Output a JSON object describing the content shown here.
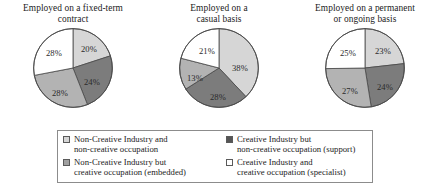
{
  "chart_data": [
    {
      "type": "pie",
      "title": "Employed on a fixed-term contract",
      "title_lines": [
        "Employed on a fixed-term",
        "contract"
      ],
      "categories": [
        "Non-Creative Industry and non-creative occupation",
        "Creative Industry but non-creative occupation (support)",
        "Non-Creative Industry but creative occupation (embedded)",
        "Creative Industry and creative occupation (specialist)"
      ],
      "values": [
        20,
        24,
        28,
        28
      ],
      "labels": [
        "20%",
        "24%",
        "28%",
        "28%"
      ],
      "colors": [
        "#d6d6d6",
        "#7c7c7c",
        "#b3b3b3",
        "#ffffff"
      ],
      "legend_position": "bottom",
      "grid": false
    },
    {
      "type": "pie",
      "title": "Employed on a casual basis",
      "title_lines": [
        "Employed on a",
        "casual basis"
      ],
      "categories": [
        "Non-Creative Industry and non-creative occupation",
        "Creative Industry but non-creative occupation (support)",
        "Non-Creative Industry but creative occupation (embedded)",
        "Creative Industry and creative occupation (specialist)"
      ],
      "values": [
        38,
        28,
        13,
        21
      ],
      "labels": [
        "38%",
        "28%",
        "13%",
        "21%"
      ],
      "colors": [
        "#d6d6d6",
        "#7c7c7c",
        "#b3b3b3",
        "#ffffff"
      ],
      "legend_position": "bottom",
      "grid": false
    },
    {
      "type": "pie",
      "title": "Employed on a permanent or ongoing basis",
      "title_lines": [
        "Employed on a permanent",
        "or ongoing basis"
      ],
      "categories": [
        "Non-Creative Industry and non-creative occupation",
        "Creative Industry but non-creative occupation (support)",
        "Non-Creative Industry but creative occupation (embedded)",
        "Creative Industry and creative occupation (specialist)"
      ],
      "values": [
        23,
        24,
        27,
        25
      ],
      "labels": [
        "23%",
        "24%",
        "27%",
        "25%"
      ],
      "colors": [
        "#d6d6d6",
        "#7c7c7c",
        "#b3b3b3",
        "#ffffff"
      ],
      "legend_position": "bottom",
      "grid": false
    }
  ],
  "legend": {
    "items": [
      {
        "color": "#d6d6d6",
        "line1": "Non-Creative Industry and",
        "line2": "non-creative occupation"
      },
      {
        "color": "#555555",
        "line1": "Creative Industry but",
        "line2": "non-creative occupation (support)"
      },
      {
        "color": "#a0a0a0",
        "line1": "Non-Creative Industry but",
        "line2": "creative occupation (embedded)"
      },
      {
        "color": "#ffffff",
        "line1": "Creative Industry and",
        "line2": "creative occupation (specialist)"
      }
    ]
  },
  "colors": {
    "light_gray": "#d6d6d6",
    "mid_gray": "#b3b3b3",
    "dark_gray": "#7c7c7c",
    "white": "#ffffff",
    "outline": "#4a4a4a",
    "legend_border": "#8c8c8c"
  }
}
